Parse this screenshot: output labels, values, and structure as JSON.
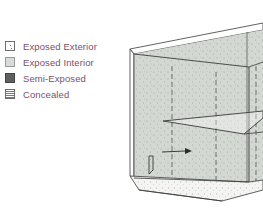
{
  "legend": {
    "items": [
      {
        "label": "Exposed Exterior",
        "swatch": "exposed-exterior",
        "color": "#ffffff"
      },
      {
        "label": "Exposed Interior",
        "swatch": "exposed-interior",
        "color": "#d8dcd8"
      },
      {
        "label": "Semi-Exposed",
        "swatch": "semi-exposed",
        "color": "#5e605e"
      },
      {
        "label": "Concealed",
        "swatch": "concealed",
        "color": "#7a7a7a"
      }
    ],
    "text_color": "#7a4f6e"
  },
  "drawing": {
    "subject": "cabinet-isometric",
    "interior_fill": "#d3d8d2",
    "line_color": "#3a3a3a"
  }
}
